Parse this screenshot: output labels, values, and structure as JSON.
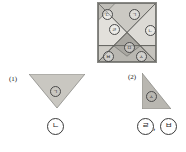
{
  "worksheet": {
    "tangram": {
      "name": "tangram-square",
      "shape": "square",
      "piece_count": 7,
      "fill_color": "#cfcdc8",
      "border_color": "#8a8a86",
      "pieces": [
        {
          "id": "piece-a",
          "label": "ㄱ",
          "position": "top-center",
          "type": "large-triangle"
        },
        {
          "id": "piece-b",
          "label": "ㄴ",
          "position": "right-center",
          "type": "large-triangle"
        },
        {
          "id": "piece-c",
          "label": "ㄷ",
          "position": "top-left-corner",
          "type": "small-triangle"
        },
        {
          "id": "piece-d",
          "label": "ㄹ",
          "position": "left-center",
          "type": "medium-triangle"
        },
        {
          "id": "piece-e",
          "label": "ㅁ",
          "position": "center",
          "type": "square-or-parallelogram"
        },
        {
          "id": "piece-f",
          "label": "ㅂ",
          "position": "bottom-left",
          "type": "small-triangle"
        },
        {
          "id": "piece-g",
          "label": "ㅅ",
          "position": "bottom-right",
          "type": "medium-triangle"
        }
      ]
    },
    "questions": [
      {
        "number": "(1)",
        "shape_name": "downward-triangle",
        "inner_label": "ㄱ",
        "answers": [
          "ㄴ"
        ]
      },
      {
        "number": "(2)",
        "shape_name": "right-triangle",
        "inner_label": "ㅅ",
        "answers": [
          "ㄹ",
          "ㅂ"
        ],
        "separator": ","
      }
    ]
  }
}
